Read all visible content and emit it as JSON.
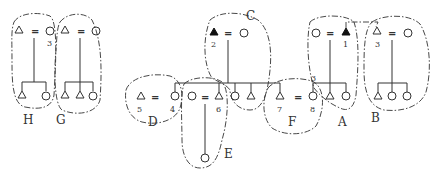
{
  "diagram": {
    "type": "kinship-diagram",
    "symbols": {
      "male": "triangle",
      "female": "circle",
      "marriage": "=",
      "ego_filled": "filled-triangle"
    },
    "groups": [
      {
        "id": "H",
        "label": "H"
      },
      {
        "id": "G",
        "label": "G"
      },
      {
        "id": "C",
        "label": "C"
      },
      {
        "id": "D",
        "label": "D"
      },
      {
        "id": "E",
        "label": "E"
      },
      {
        "id": "F",
        "label": "F"
      },
      {
        "id": "A",
        "label": "A"
      },
      {
        "id": "B",
        "label": "B"
      }
    ],
    "numbers": {
      "n1": "1",
      "n2": "2",
      "n3_left": "3",
      "n3_right": "3",
      "n4": "4",
      "n5": "5",
      "n6": "6",
      "n7": "7",
      "n8": "8",
      "n3_a": "3"
    },
    "marriage_sign": "="
  }
}
